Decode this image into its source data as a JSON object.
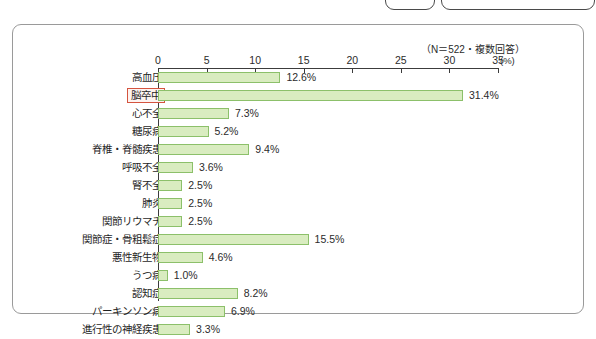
{
  "window": {
    "tabs": [
      "",
      ""
    ]
  },
  "panel": {
    "note": "（N＝522・複数回答）"
  },
  "axis": {
    "unit": "(%)",
    "ticks": [
      0,
      5,
      10,
      15,
      20,
      25,
      30,
      35
    ],
    "tick_labels": [
      "0",
      "5",
      "10",
      "15",
      "20",
      "25",
      "30",
      "35"
    ]
  },
  "chart_data": {
    "type": "bar",
    "orientation": "horizontal",
    "title": "",
    "subtitle": "（N＝522・複数回答）",
    "xlabel": "(%)",
    "ylabel": "",
    "xlim": [
      0,
      35
    ],
    "grid": false,
    "legend": "none",
    "highlight_category": "脳卒中",
    "colors": {
      "bar_fill": "#d9ecc0",
      "bar_border": "#8cc06a",
      "highlight_border": "#d4543f",
      "axis": "#3c3c3c",
      "text": "#1f1f1f"
    },
    "categories": [
      "高血圧",
      "脳卒中",
      "心不全",
      "糖尿病",
      "脊椎・脊髄疾患",
      "呼吸不全",
      "腎不全",
      "肺炎",
      "関節リウマチ",
      "関節症・骨粗鬆症",
      "悪性新生物",
      "うつ病",
      "認知症",
      "パーキンソン病",
      "進行性の神経疾患"
    ],
    "values": [
      12.6,
      31.4,
      7.3,
      5.2,
      9.4,
      3.6,
      2.5,
      2.5,
      2.5,
      15.5,
      4.6,
      1.0,
      8.2,
      6.9,
      3.3
    ],
    "value_labels": [
      "12.6%",
      "31.4%",
      "7.3%",
      "5.2%",
      "9.4%",
      "3.6%",
      "2.5%",
      "2.5%",
      "2.5%",
      "15.5%",
      "4.6%",
      "1.0%",
      "8.2%",
      "6.9%",
      "3.3%"
    ]
  }
}
